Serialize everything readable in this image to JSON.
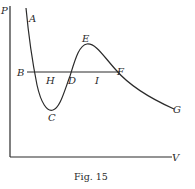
{
  "figure": {
    "caption": "Fig. 15",
    "ink_color": "#2a2a2a",
    "background": "#ffffff"
  },
  "axes": {
    "y_label": "P",
    "x_label": "V"
  },
  "points": {
    "A": "A",
    "B": "B",
    "C": "C",
    "D": "D",
    "E": "E",
    "F": "F",
    "G": "G",
    "H": "H",
    "I": "I"
  }
}
